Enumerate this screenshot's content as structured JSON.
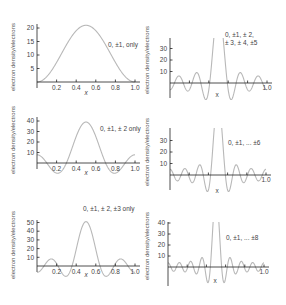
{
  "chart_data": [
    {
      "type": "line",
      "panel": "left-1",
      "annotation": "0, ±1, only",
      "xlabel": "x",
      "ylabel": "electron density/electrons",
      "xticks": [
        "0.2",
        "0.4",
        "0.6",
        "0.8",
        "1.0"
      ],
      "yticks": [
        "5",
        "10",
        "15",
        "20"
      ],
      "xlim": [
        0,
        1.0
      ],
      "ylim": [
        -3,
        23
      ],
      "orders": [
        0,
        1
      ],
      "peak": {
        "x": 0.5,
        "y": 21
      }
    },
    {
      "type": "line",
      "panel": "left-2",
      "annotation": "0, ±1, ± 2 only",
      "xlabel": "x",
      "ylabel": "electron density/electrons",
      "xticks": [
        "0.2",
        "0.4",
        "0.6",
        "0.8",
        "1.0"
      ],
      "yticks": [
        "10",
        "20",
        "30",
        "40"
      ],
      "xlim": [
        0,
        1.0
      ],
      "ylim": [
        -10,
        45
      ],
      "orders": [
        0,
        1,
        2
      ],
      "peak": {
        "x": 0.5,
        "y": 39
      }
    },
    {
      "type": "line",
      "panel": "left-3",
      "annotation": "0, ±1, ± 2, ±3 only",
      "xlabel": "x",
      "ylabel": "electron density/electrons",
      "xticks": [
        "0.2",
        "0.4",
        "0.6",
        "0.8",
        "1.0"
      ],
      "yticks": [
        "10",
        "20",
        "30",
        "40",
        "50"
      ],
      "xlim": [
        0,
        1.0
      ],
      "ylim": [
        -12,
        55
      ],
      "orders": [
        0,
        1,
        2,
        3
      ],
      "peak": {
        "x": 0.5,
        "y": 51
      }
    },
    {
      "type": "line",
      "panel": "right-1",
      "annotation": "0, ±1, ± 2, ± 3, ± 4, ±5",
      "xlabel": "x",
      "ylabel": "electron density/electrons",
      "xticks": [
        "1.0"
      ],
      "yticks": [
        "10",
        "20",
        "30"
      ],
      "xlim": [
        0,
        1.0
      ],
      "ylim": [
        -15,
        38
      ],
      "orders": [
        0,
        1,
        2,
        3,
        4,
        5
      ],
      "peak": {
        "x": 0.5,
        "y": "off-scale"
      }
    },
    {
      "type": "line",
      "panel": "right-2",
      "annotation": "0, ±1, ... ±6",
      "xlabel": "x",
      "ylabel": "electron density/electrons",
      "xticks": [
        "1.0"
      ],
      "yticks": [
        "10",
        "20",
        "30"
      ],
      "xlim": [
        0,
        1.0
      ],
      "ylim": [
        -15,
        38
      ],
      "orders": [
        0,
        1,
        2,
        3,
        4,
        5,
        6
      ],
      "peak": {
        "x": 0.5,
        "y": "off-scale"
      }
    },
    {
      "type": "line",
      "panel": "right-3",
      "annotation": "0, ±1, ... ±8",
      "xlabel": "x",
      "ylabel": "electron density/electrons",
      "xticks": [
        "1.0"
      ],
      "yticks": [
        "10",
        "20",
        "30",
        "40"
      ],
      "xlim": [
        0,
        1.0
      ],
      "ylim": [
        -15,
        45
      ],
      "orders": [
        0,
        1,
        2,
        3,
        4,
        5,
        6,
        7,
        8
      ],
      "peak": {
        "x": 0.5,
        "y": "off-scale"
      }
    }
  ]
}
